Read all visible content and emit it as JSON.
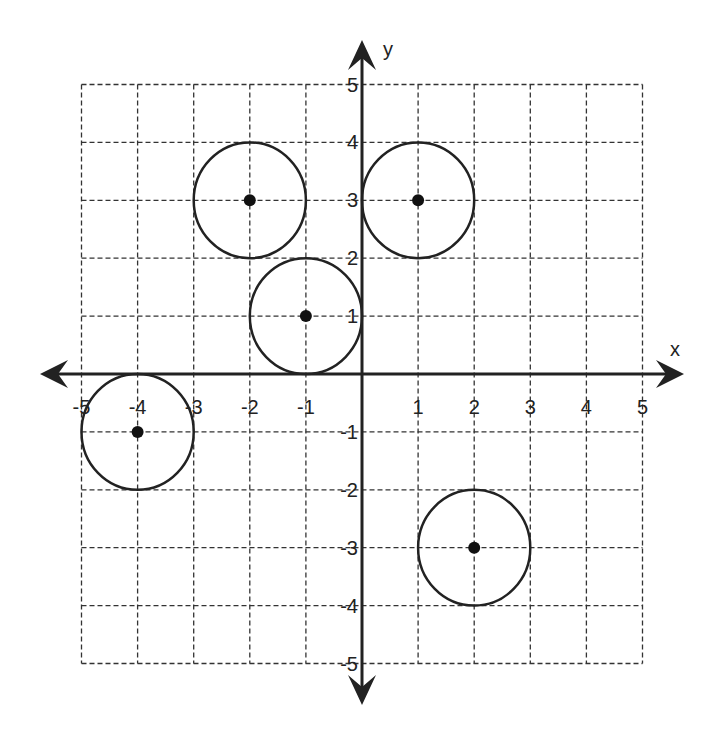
{
  "chart_data": {
    "type": "diagram",
    "title": "",
    "xlabel": "x",
    "ylabel": "y",
    "xlim": [
      -5,
      5
    ],
    "ylim": [
      -5,
      5
    ],
    "grid": true,
    "grid_style": "dashed",
    "x_ticks": [
      "-5",
      "-4",
      "-3",
      "-2",
      "-1",
      "1",
      "2",
      "3",
      "4",
      "5"
    ],
    "y_ticks": [
      "5",
      "4",
      "3",
      "2",
      "1",
      "-1",
      "-2",
      "-3",
      "-4",
      "-5"
    ],
    "circles": [
      {
        "center": [
          -2,
          3
        ],
        "radius": 1
      },
      {
        "center": [
          1,
          3
        ],
        "radius": 1
      },
      {
        "center": [
          -1,
          1
        ],
        "radius": 1
      },
      {
        "center": [
          -4,
          -1
        ],
        "radius": 1
      },
      {
        "center": [
          2,
          -3
        ],
        "radius": 1
      }
    ]
  },
  "axes": {
    "x_label": "x",
    "y_label": "y"
  },
  "colors": {
    "ink": "#222222",
    "grid": "#333333",
    "background": "#ffffff"
  }
}
